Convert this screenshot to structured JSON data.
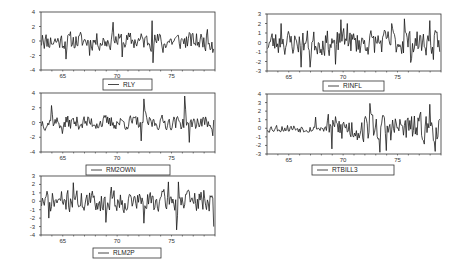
{
  "chart_data": [
    {
      "type": "line",
      "title": "",
      "series_name": "RLY",
      "xlabel": "",
      "ylabel": "",
      "xlim": [
        63.0,
        79.0
      ],
      "ylim": [
        -4,
        4
      ],
      "xticks": [
        65,
        70,
        75
      ],
      "yticks": [
        4,
        2,
        0,
        -2,
        -4
      ],
      "grid": false,
      "legend_position": "below",
      "frame": {
        "x": 41,
        "y": 12,
        "w": 174,
        "h": 58
      },
      "legend_box": {
        "x": 103,
        "y": 79,
        "w": 49,
        "h": 11
      },
      "seed": 11,
      "amp": 0.9,
      "spikes": [
        [
          63.1,
          0.8
        ],
        [
          65.3,
          -2.5
        ],
        [
          67.5,
          -2.0
        ],
        [
          69.6,
          2.6
        ],
        [
          70.5,
          -2.2
        ],
        [
          73.2,
          2.8
        ],
        [
          73.3,
          -3.0
        ],
        [
          74.2,
          -1.6
        ],
        [
          78.8,
          -1.6
        ],
        [
          78.3,
          1.6
        ]
      ]
    },
    {
      "type": "line",
      "title": "",
      "series_name": "RINFL",
      "xlabel": "",
      "ylabel": "",
      "xlim": [
        63.0,
        79.0
      ],
      "ylim": [
        -3,
        3
      ],
      "xticks": [
        65,
        70,
        75
      ],
      "yticks": [
        3,
        2,
        1,
        0,
        -1,
        -2,
        -3
      ],
      "grid": false,
      "legend_position": "below",
      "frame": {
        "x": 267,
        "y": 14,
        "w": 174,
        "h": 57
      },
      "legend_box": {
        "x": 323,
        "y": 81,
        "w": 61,
        "h": 10
      },
      "seed": 23,
      "amp": 0.95,
      "spikes": [
        [
          64.3,
          2.0
        ],
        [
          66.1,
          -2.6
        ],
        [
          67.0,
          -2.6
        ],
        [
          69.3,
          -2.3
        ],
        [
          69.8,
          2.4
        ],
        [
          70.4,
          2.0
        ],
        [
          74.5,
          2.0
        ],
        [
          75.6,
          2.5
        ],
        [
          76.2,
          -2.1
        ],
        [
          78.0,
          2.3
        ],
        [
          78.3,
          -1.8
        ]
      ]
    },
    {
      "type": "line",
      "title": "",
      "series_name": "RM2OWN",
      "xlabel": "",
      "ylabel": "",
      "xlim": [
        63.0,
        79.0
      ],
      "ylim": [
        -4,
        4
      ],
      "xticks": [
        65,
        70,
        75
      ],
      "yticks": [
        4,
        2,
        0,
        -2,
        -4
      ],
      "grid": false,
      "legend_position": "below",
      "frame": {
        "x": 41,
        "y": 93,
        "w": 174,
        "h": 59
      },
      "legend_box": {
        "x": 86,
        "y": 165,
        "w": 84,
        "h": 10
      },
      "seed": 37,
      "amp": 0.7,
      "spikes": [
        [
          64.0,
          2.3
        ],
        [
          72.2,
          -2.5
        ],
        [
          72.5,
          3.2
        ],
        [
          76.2,
          3.6
        ],
        [
          76.6,
          -2.7
        ],
        [
          78.8,
          -1.8
        ],
        [
          65.0,
          -1.5
        ]
      ]
    },
    {
      "type": "line",
      "title": "",
      "series_name": "RTBILL3",
      "xlabel": "",
      "ylabel": "",
      "xlim": [
        63.0,
        79.0
      ],
      "ylim": [
        -3,
        4
      ],
      "xticks": [
        65,
        70,
        75
      ],
      "yticks": [
        4,
        3,
        2,
        1,
        0,
        -1,
        -2,
        -3
      ],
      "grid": false,
      "legend_position": "below",
      "frame": {
        "x": 267,
        "y": 94,
        "w": 174,
        "h": 60
      },
      "legend_box": {
        "x": 312,
        "y": 165,
        "w": 82,
        "h": 10
      },
      "seed": 53,
      "amp": 0.35,
      "amp_late": 1.2,
      "late_start": 68.5,
      "spikes": [
        [
          69.0,
          -2.4
        ],
        [
          72.5,
          2.9
        ],
        [
          73.4,
          -2.8
        ],
        [
          74.0,
          -2.6
        ],
        [
          78.0,
          2.8
        ],
        [
          78.5,
          -2.7
        ],
        [
          67.5,
          1.3
        ]
      ]
    },
    {
      "type": "line",
      "title": "",
      "series_name": "RLM2P",
      "xlabel": "",
      "ylabel": "",
      "xlim": [
        63.0,
        79.0
      ],
      "ylim": [
        -4,
        3
      ],
      "xticks": [
        65,
        70,
        75
      ],
      "yticks": [
        3,
        2,
        1,
        0,
        -1,
        -2,
        -3,
        -4
      ],
      "grid": false,
      "legend_position": "below",
      "frame": {
        "x": 41,
        "y": 176,
        "w": 174,
        "h": 59
      },
      "legend_box": {
        "x": 93,
        "y": 248,
        "w": 68,
        "h": 10
      },
      "seed": 71,
      "amp": 0.9,
      "spikes": [
        [
          63.7,
          -2.0
        ],
        [
          66.0,
          2.2
        ],
        [
          69.0,
          -2.5
        ],
        [
          69.5,
          1.7
        ],
        [
          72.5,
          -2.6
        ],
        [
          74.7,
          2.3
        ],
        [
          75.5,
          -3.4
        ],
        [
          75.6,
          2.3
        ],
        [
          78.0,
          1.3
        ],
        [
          78.9,
          -3.0
        ]
      ]
    }
  ],
  "panels": [
    {
      "legend_label": "RLY"
    },
    {
      "legend_label": "RINFL"
    },
    {
      "legend_label": "RM2OWN"
    },
    {
      "legend_label": "RTBILL3"
    },
    {
      "legend_label": "RLM2P"
    }
  ],
  "colors": {
    "line": "#1a1a1a",
    "frame": "#333333",
    "background": "#ffffff"
  }
}
